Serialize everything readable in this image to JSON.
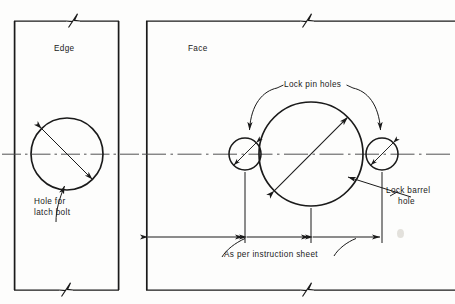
{
  "drawing": {
    "title": "Lock installation template",
    "ink_color": "#1a1a1a",
    "paper_color": "#fdfdfc",
    "views": [
      {
        "name": "edge-view",
        "label": "Edge"
      },
      {
        "name": "face-view",
        "label": "Face"
      }
    ],
    "annotations": [
      {
        "name": "hole-for-latch-bolt",
        "lines": [
          "Hole for",
          "latch bolt"
        ],
        "text": "Hole for latch bolt"
      },
      {
        "name": "lock-pin-holes",
        "lines": [
          "Lock pin holes"
        ],
        "text": "Lock pin holes"
      },
      {
        "name": "lock-barrel-hole",
        "lines": [
          "Lock barrel",
          "hole"
        ],
        "text": "Lock barrel hole"
      },
      {
        "name": "as-per-instruction-sheet",
        "lines": [
          "As per instruction sheet"
        ],
        "text": "As per instruction sheet"
      }
    ],
    "labels": {
      "edge": "Edge",
      "face": "Face",
      "hole_for_latch_bolt_line1": "Hole for",
      "hole_for_latch_bolt_line2": "latch bolt",
      "lock_pin_holes": "Lock pin holes",
      "lock_barrel_hole_line1": "Lock barrel",
      "lock_barrel_hole_line2": "hole",
      "as_per_instruction_sheet": "As per instruction sheet"
    },
    "geometry": {
      "centerline_y": 154,
      "edge_panel": {
        "left": 14,
        "right": 119,
        "top": 21,
        "bottom": 290
      },
      "face_panel": {
        "left": 146,
        "right": 455,
        "top": 21,
        "bottom": 290
      },
      "latch_bolt_hole": {
        "cx": 67,
        "cy": 154,
        "r": 36
      },
      "lock_barrel_hole": {
        "cx": 311,
        "cy": 154,
        "r": 52
      },
      "lock_pin_hole_left": {
        "cx": 245,
        "cy": 154,
        "r": 16
      },
      "lock_pin_hole_right": {
        "cx": 382,
        "cy": 154,
        "r": 16
      },
      "dimension_line_y": 237
    }
  }
}
